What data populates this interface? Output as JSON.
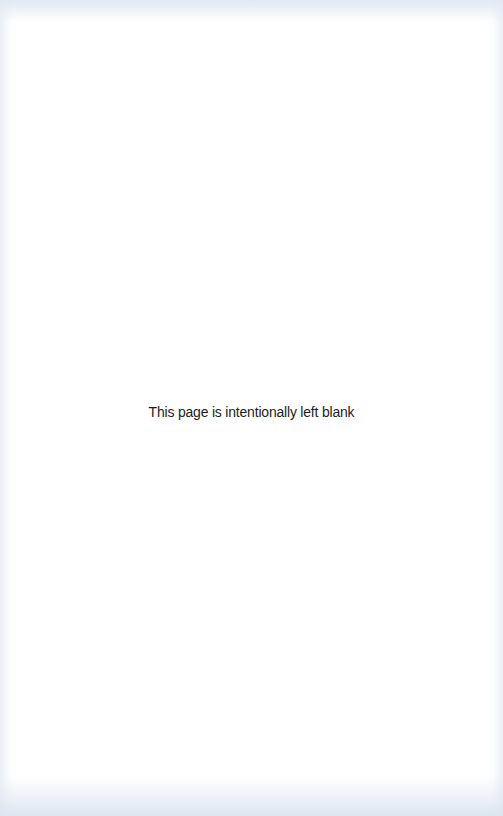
{
  "page": {
    "notice_text": "This page is intentionally left blank",
    "background_color": "#ffffff",
    "text_color": "#1c1c1c"
  }
}
